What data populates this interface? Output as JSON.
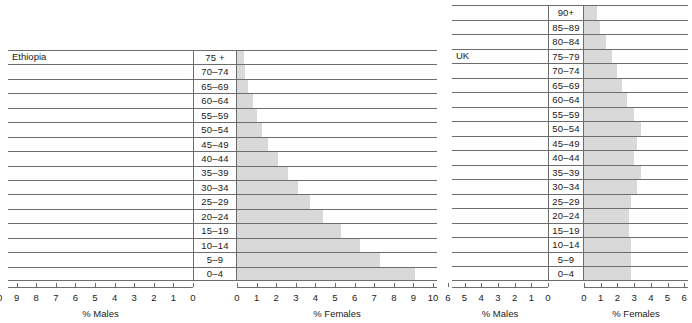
{
  "chart_data": [
    {
      "type": "bar",
      "title": "Ethiopia",
      "subtype": "population-pyramid",
      "categories": [
        "75 +",
        "70–74",
        "65–69",
        "60–64",
        "55–59",
        "50–54",
        "45–49",
        "40–44",
        "35–39",
        "30–34",
        "25–29",
        "20–24",
        "15–19",
        "10–14",
        "5–9",
        "0–4"
      ],
      "series": [
        {
          "name": "% Males",
          "values": [
            0,
            0,
            0,
            0,
            0,
            0,
            0,
            0,
            0,
            0,
            0,
            0,
            0,
            0,
            0,
            0
          ]
        },
        {
          "name": "% Females",
          "values": [
            0.35,
            0.4,
            0.55,
            0.8,
            1.0,
            1.3,
            1.6,
            2.1,
            2.6,
            3.1,
            3.7,
            4.4,
            5.3,
            6.3,
            7.3,
            9.1
          ]
        }
      ],
      "xlabel_left": "% Males",
      "xlabel_right": "% Females",
      "ylabel": "",
      "xlim_left": [
        0,
        10
      ],
      "xlim_right": [
        0,
        10
      ],
      "xticks_left": [
        "10",
        "9",
        "8",
        "7",
        "6",
        "5",
        "4",
        "3",
        "2",
        "1",
        "0"
      ],
      "xticks_right": [
        "0",
        "1",
        "2",
        "3",
        "4",
        "5",
        "6",
        "7",
        "8",
        "9",
        "10"
      ],
      "grid": true,
      "legend": "none"
    },
    {
      "type": "bar",
      "title": "UK",
      "subtype": "population-pyramid",
      "categories": [
        "90+",
        "85–89",
        "80–84",
        "75–79",
        "70–74",
        "65–69",
        "60–64",
        "55–59",
        "50–54",
        "45–49",
        "40–44",
        "35–39",
        "30–34",
        "25–29",
        "20–24",
        "15–19",
        "10–14",
        "5–9",
        "0–4"
      ],
      "series": [
        {
          "name": "% Males",
          "values": [
            0,
            0,
            0,
            0,
            0,
            0,
            0,
            0,
            0,
            0,
            0,
            0,
            0,
            0,
            0,
            0,
            0,
            0,
            0
          ]
        },
        {
          "name": "% Females",
          "values": [
            0.75,
            0.95,
            1.3,
            1.65,
            1.95,
            2.3,
            2.55,
            3.0,
            3.4,
            3.2,
            3.0,
            3.4,
            3.2,
            2.8,
            2.7,
            2.7,
            2.8,
            2.8,
            2.8
          ]
        }
      ],
      "xlabel_left": "% Males",
      "xlabel_right": "% Females",
      "ylabel": "",
      "xlim_left": [
        0,
        6
      ],
      "xlim_right": [
        0,
        6
      ],
      "xticks_left": [
        "6",
        "5",
        "4",
        "3",
        "2",
        "1",
        "0"
      ],
      "xticks_right": [
        "0",
        "1",
        "2",
        "3",
        "4",
        "5",
        "6"
      ],
      "grid": true,
      "legend": "none"
    }
  ],
  "colors": {
    "bar_fill": "#d9d9d9",
    "line": "#6d6d6d",
    "text": "#1a1a1a",
    "background": "#ffffff"
  }
}
